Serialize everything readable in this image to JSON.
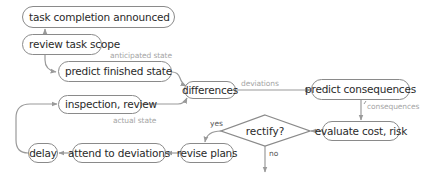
{
  "diagram": {
    "nodes": {
      "task_completion_announced": "task completion announced",
      "review_task_scope": "review task scope",
      "predict_finished_state": "predict finished state",
      "inspection_review": "inspection, review",
      "differences": "differences",
      "predict_consequences": "predict consequences",
      "evaluate_cost_risk": "evaluate cost, risk",
      "rectify": "rectify?",
      "revise_plans": "revise plans",
      "attend_to_deviations": "attend to deviations",
      "delay": "delay"
    },
    "edge_labels": {
      "anticipated_state": "anticipated state",
      "actual_state": "actual state",
      "deviations": "deviations",
      "consequences": "consequences",
      "yes": "yes",
      "no": "no"
    },
    "colors": {
      "node_border": "#8a8a8a",
      "node_text": "#2a2a2a",
      "edge": "#9a9a9a",
      "edge_label": "#a5a5a5"
    }
  }
}
